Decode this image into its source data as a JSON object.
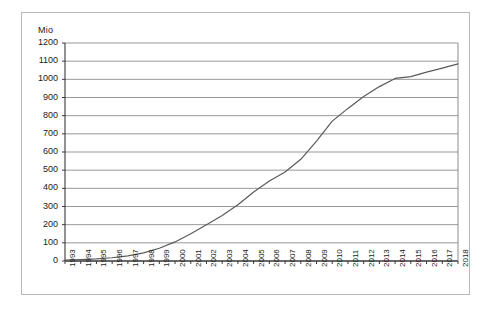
{
  "chart_data": {
    "type": "line",
    "title": "",
    "subtitle": "",
    "xlabel": "",
    "ylabel": "Mio",
    "unit_label": "Mio",
    "grid": true,
    "legend": "none",
    "xlim": [
      1993,
      2018
    ],
    "ylim": [
      0,
      1200
    ],
    "y_tick_step": 100,
    "y_ticks": [
      0,
      100,
      200,
      300,
      400,
      500,
      600,
      700,
      800,
      900,
      1000,
      1100,
      1200
    ],
    "y_tick_labels": [
      "0",
      "100",
      "200",
      "300",
      "400",
      "500",
      "600",
      "700",
      "800",
      "900",
      "1000",
      "1100",
      "1200"
    ],
    "categories": [
      "1993",
      "1994",
      "1995",
      "1996",
      "1997",
      "1998",
      "1999",
      "2000",
      "2001",
      "2002",
      "2003",
      "2004",
      "2005",
      "2006",
      "2007",
      "2008",
      "2009",
      "2010",
      "2011",
      "2012",
      "2013",
      "2014",
      "2015",
      "2016",
      "2017",
      "2018"
    ],
    "x": [
      1993,
      1994,
      1995,
      1996,
      1997,
      1998,
      1999,
      2000,
      2001,
      2002,
      2003,
      2004,
      2005,
      2006,
      2007,
      2008,
      2009,
      2010,
      2011,
      2012,
      2013,
      2014,
      2015,
      2016,
      2017,
      2018
    ],
    "values": [
      5,
      8,
      12,
      18,
      28,
      45,
      70,
      105,
      150,
      200,
      250,
      310,
      380,
      440,
      490,
      560,
      660,
      770,
      840,
      905,
      960,
      1005,
      1015,
      1040,
      1062,
      1085
    ],
    "series": [
      {
        "name": "series-1",
        "color": "#555555",
        "values": [
          5,
          8,
          12,
          18,
          28,
          45,
          70,
          105,
          150,
          200,
          250,
          310,
          380,
          440,
          490,
          560,
          660,
          770,
          840,
          905,
          960,
          1005,
          1015,
          1040,
          1062,
          1085
        ]
      }
    ],
    "colors": {
      "line": "#5a5a5a",
      "grid": "#8c8c8c",
      "axis": "#3a3a3a",
      "frame": "#b9b9b9",
      "background": "#ffffff",
      "text": "#1a1a1a"
    }
  }
}
